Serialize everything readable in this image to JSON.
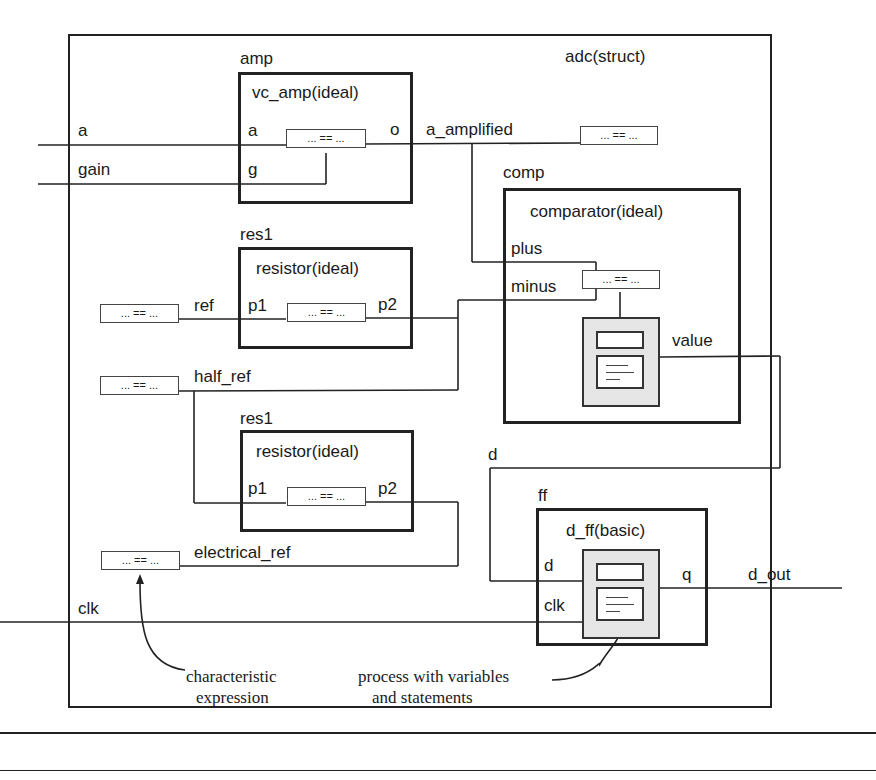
{
  "diagram": {
    "architecture_label": "adc(struct)",
    "expr_glyph": "... == ...",
    "components": {
      "amp": {
        "instance": "amp",
        "entity": "vc_amp(ideal)",
        "ports": {
          "in_a": "a",
          "in_g": "g",
          "out": "o"
        }
      },
      "comp": {
        "instance": "comp",
        "entity": "comparator(ideal)",
        "ports": {
          "plus": "plus",
          "minus": "minus",
          "value": "value"
        }
      },
      "res_top": {
        "instance": "res1",
        "entity": "resistor(ideal)",
        "ports": {
          "p1": "p1",
          "p2": "p2"
        }
      },
      "res_bottom": {
        "instance": "res1",
        "entity": "resistor(ideal)",
        "ports": {
          "p1": "p1",
          "p2": "p2"
        }
      },
      "ff": {
        "instance": "ff",
        "entity": "d_ff(basic)",
        "ports": {
          "d": "d",
          "clk": "clk",
          "q": "q"
        }
      }
    },
    "signals": {
      "a": "a",
      "gain": "gain",
      "a_amplified": "a_amplified",
      "ref": "ref",
      "half_ref": "half_ref",
      "electrical_ref": "electrical_ref",
      "clk": "clk",
      "d": "d",
      "d_out": "d_out"
    },
    "annotations": {
      "characteristic_line1": "characteristic",
      "characteristic_line2": "expression",
      "process_line1": "process with variables",
      "process_line2": "and statements"
    }
  }
}
